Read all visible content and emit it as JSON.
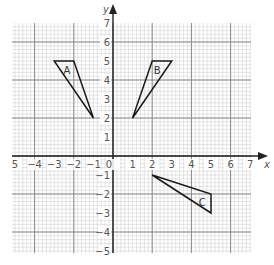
{
  "diagram": {
    "type": "coordinate-grid",
    "x_axis": {
      "label": "x",
      "min": -5,
      "max": 7,
      "tick_labels": [
        "5",
        "−4",
        "−3",
        "−2",
        "−1",
        "0",
        "1",
        "2",
        "3",
        "4",
        "5",
        "6",
        "7"
      ]
    },
    "y_axis": {
      "label": "y",
      "min": -5,
      "max": 7,
      "tick_labels_positive": [
        "1",
        "2",
        "3",
        "4",
        "5",
        "6",
        "7"
      ],
      "tick_labels_negative": [
        "−1",
        "−2",
        "−3",
        "−4",
        "−5"
      ]
    },
    "shapes": [
      {
        "label": "A",
        "vertices": [
          [
            -3,
            5
          ],
          [
            -2,
            5
          ],
          [
            -1,
            2
          ]
        ],
        "label_pos": [
          -2.35,
          4.55
        ]
      },
      {
        "label": "B",
        "vertices": [
          [
            2,
            5
          ],
          [
            3,
            5
          ],
          [
            1,
            2
          ]
        ],
        "label_pos": [
          2.25,
          4.55
        ]
      },
      {
        "label": "C",
        "vertices": [
          [
            2,
            -1
          ],
          [
            5,
            -2
          ],
          [
            5,
            -3
          ]
        ],
        "label_pos": [
          4.55,
          -2.4
        ]
      }
    ],
    "colors": {
      "grid_minor": "#d4d4d4",
      "grid_major": "#8a8a8a",
      "axis": "#222222",
      "shape_stroke": "#1a1a1a",
      "text": "#555555"
    }
  }
}
